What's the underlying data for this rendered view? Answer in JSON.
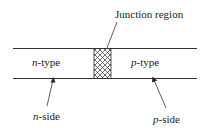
{
  "diagram": {
    "title_label": "Junction region",
    "left_region": {
      "italic": "n",
      "rest": "-type"
    },
    "right_region": {
      "italic": "p",
      "rest": "-type"
    },
    "left_side": {
      "italic": "n",
      "rest": "-side"
    },
    "right_side": {
      "italic": "p",
      "rest": "-side"
    },
    "colors": {
      "line": "#333333",
      "background": "#ffffff"
    }
  }
}
